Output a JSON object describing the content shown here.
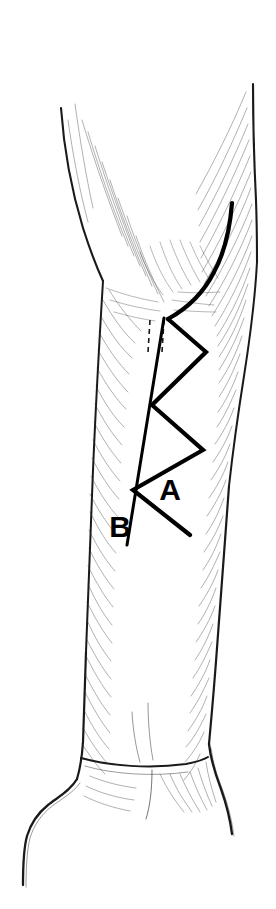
{
  "figure": {
    "style": "pen-and-ink line drawing, black on white, hatched shading",
    "background_color": "#ffffff",
    "ink_color": "#000000",
    "width": 276,
    "height": 909
  },
  "labels": [
    {
      "id": "label-a",
      "text": "A",
      "x": 170,
      "y": 500,
      "refers_to": "zigzag (Bruner) incision line",
      "font_size": 30,
      "bold": true
    },
    {
      "id": "label-b",
      "text": "B",
      "x": 120,
      "y": 537,
      "refers_to": "straight longitudinal incision line",
      "font_size": 30,
      "bold": true
    }
  ],
  "annotations": {
    "incision_a": {
      "name": "zigzag-incision",
      "description": "Thick curved proximal limb descending from lateral forearm, continuing as a four-limb zigzag across the volar forearm",
      "stroke_width": 4,
      "curve_start": [
        232,
        203
      ],
      "points": [
        [
          232,
          203
        ],
        [
          228,
          232
        ],
        [
          218,
          262
        ],
        [
          203,
          288
        ],
        [
          187,
          305
        ],
        [
          168,
          319
        ],
        [
          206,
          352
        ],
        [
          152,
          405
        ],
        [
          203,
          450
        ],
        [
          133,
          490
        ],
        [
          190,
          535
        ]
      ]
    },
    "incision_b": {
      "name": "straight-longitudinal-incision",
      "description": "Thin straight line running distally from the antecubital region, crossing the zigzag",
      "stroke_width": 3,
      "points": [
        [
          164,
          318
        ],
        [
          127,
          545
        ]
      ]
    },
    "dashed_marks": {
      "name": "dashed-guide-lines",
      "description": "Two short dashed vertical guide marks beneath the antecubital crease",
      "lines": [
        [
          150,
          320,
          148,
          352
        ],
        [
          164,
          320,
          162,
          352
        ]
      ]
    }
  },
  "outline": {
    "left_contour": "proximal lateral border descending from upper left, narrowing toward the wrist then flaring at the thenar eminence",
    "right_contour": "proximal medial border descending from upper right, narrowing toward the wrist then flaring at the hypothenar side",
    "wrist_crease": "transverse crease near y=895 separating forearm from hand",
    "hand": "palm base with thenar and hypothenar bulges at bottom of frame"
  }
}
